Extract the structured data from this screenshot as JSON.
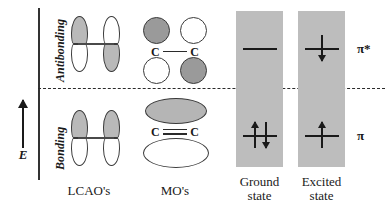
{
  "diagram": {
    "energy_axis": {
      "symbol": "E",
      "direction_icon": "up-arrow-icon"
    },
    "regions": [
      {
        "key": "antibonding",
        "label": "Antibonding"
      },
      {
        "key": "bonding",
        "label": "Bonding"
      }
    ],
    "separator": {
      "name": "nonbonding-dashed-line",
      "style": "dashed"
    }
  },
  "columns": [
    {
      "key": "lcao",
      "caption": "LCAO's"
    },
    {
      "key": "mo",
      "caption": "MO's"
    },
    {
      "key": "ground",
      "caption_line1": "Ground",
      "caption_line2": "state"
    },
    {
      "key": "excited",
      "caption_line1": "Excited",
      "caption_line2": "state"
    }
  ],
  "lcao": {
    "antibonding": {
      "left_atom": {
        "top_lobe": "shaded",
        "bottom_lobe": "plain"
      },
      "right_atom": {
        "top_lobe": "plain",
        "bottom_lobe": "shaded"
      }
    },
    "bonding": {
      "left_atom": {
        "top_lobe": "shaded",
        "bottom_lobe": "plain"
      },
      "right_atom": {
        "top_lobe": "shaded",
        "bottom_lobe": "plain"
      }
    }
  },
  "mo": {
    "antibonding": {
      "top_left": "dark",
      "top_right": "light",
      "bottom_left": "light",
      "bottom_right": "dark",
      "atom_left": "C",
      "atom_right": "C",
      "bond": "single"
    },
    "bonding": {
      "top_lobe": "dark",
      "bottom_lobe": "light",
      "atom_left": "C",
      "atom_right": "C",
      "bond": "double"
    }
  },
  "states": {
    "ground": {
      "antibonding_electrons": [],
      "bonding_electrons": [
        "up",
        "down"
      ]
    },
    "excited": {
      "antibonding_electrons": [
        "down"
      ],
      "bonding_electrons": [
        "up"
      ]
    }
  },
  "orbital_symbols": {
    "antibonding": "π*",
    "bonding": "π"
  },
  "colors": {
    "shaded_lobe": "#b9b9b9",
    "dark_lobe": "#9a9a9a",
    "state_box": "#bdbdbd",
    "ink": "#1a1a1a",
    "outline": "#3a3a3a"
  }
}
